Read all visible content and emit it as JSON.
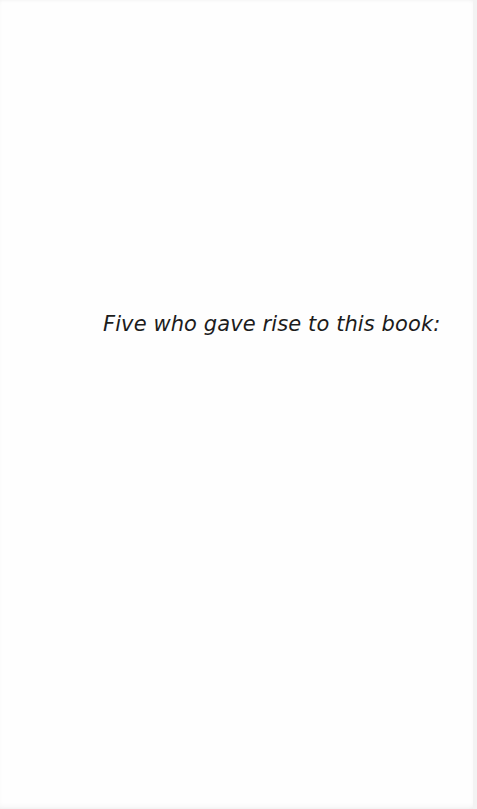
{
  "page": {
    "dedication_text": "Five who gave rise to this book:"
  },
  "colors": {
    "background": "#fefefe",
    "text": "#1c1c1c",
    "edge_shade": "#f3f3f3"
  }
}
